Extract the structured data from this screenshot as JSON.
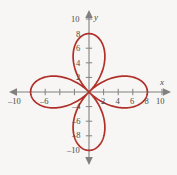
{
  "figure": {
    "background_color": "#f7f6f4",
    "width": 177,
    "height": 175
  },
  "chart_data": {
    "type": "line",
    "title": "",
    "subtitle": "",
    "xlabel": "x",
    "ylabel": "y",
    "xlim": [
      -11.5,
      11.5
    ],
    "ylim": [
      -11.5,
      11.5
    ],
    "grid": false,
    "legend": "none",
    "curve_color": "#b0302a",
    "axis_color": "#808080",
    "label_color": "#4a4a4a",
    "curve_name": "four-petaled rose",
    "polar_equation": "r = 8 cos(2θ)",
    "petal_count": 4,
    "petal_max_radius": 8,
    "petal_directions_deg": [
      0,
      90,
      180,
      270
    ],
    "petal_tips": [
      {
        "x": 8,
        "y": 0
      },
      {
        "x": 0,
        "y": 8
      },
      {
        "x": -8,
        "y": 0
      },
      {
        "x": 0,
        "y": -8
      }
    ],
    "x_ticks": [
      -10,
      -8,
      -6,
      -4,
      -2,
      2,
      4,
      6,
      8,
      10
    ],
    "x_tick_labels": [
      "-10",
      "",
      "-6",
      "",
      "",
      "2",
      "4",
      "6",
      "8",
      "10"
    ],
    "y_ticks": [
      -10,
      -8,
      -6,
      -4,
      -2,
      2,
      4,
      6,
      8,
      10
    ],
    "y_tick_labels": [
      "-10",
      "-8",
      "-6",
      "-4",
      "",
      "2",
      "4",
      "6",
      "8",
      "10"
    ],
    "axis_arrows": [
      "left",
      "right",
      "up",
      "down"
    ]
  },
  "labels": {
    "x_axis_name": "x",
    "y_axis_name": "y",
    "x_neg10": "–10",
    "x_neg6": "–6",
    "x_2": "2",
    "x_4": "4",
    "x_6": "6",
    "x_8": "8",
    "x_10": "10",
    "y_10": "10",
    "y_8": "8",
    "y_6": "6",
    "y_4": "4",
    "y_2": "2",
    "y_neg4": "–4",
    "y_neg6": "–6",
    "y_neg8": "–8",
    "y_neg10": "–10"
  }
}
